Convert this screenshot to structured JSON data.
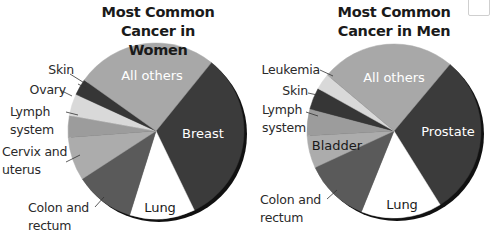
{
  "chart_data": [
    {
      "type": "pie",
      "title": "Most Common Cancer in Women",
      "title_lines": [
        "Most Common",
        "Cancer in Women"
      ],
      "start_angle_deg": 39,
      "direction": "clockwise",
      "slices": [
        {
          "label": "Breast",
          "value": 32,
          "color": "#3b3b3b",
          "label_inside": true,
          "text_color": "#ffffff"
        },
        {
          "label": "Lung",
          "value": 12,
          "color": "#ffffff",
          "label_inside": true,
          "text_color": "#1a1a1a"
        },
        {
          "label": "Colon and rectum",
          "value": 11,
          "color": "#5a5a5a",
          "label_inside": false
        },
        {
          "label": "Cervix and uterus",
          "value": 8,
          "color": "#acacac",
          "label_inside": false
        },
        {
          "label": "Lymph system",
          "value": 4,
          "color": "#9c9c9c",
          "label_inside": false
        },
        {
          "label": "Ovary",
          "value": 4,
          "color": "#d9d9d9",
          "label_inside": false
        },
        {
          "label": "Skin",
          "value": 3,
          "color": "#363636",
          "label_inside": false
        },
        {
          "label": "All others",
          "value": 26,
          "color": "#a8a8a8",
          "label_inside": true,
          "text_color": "#ffffff"
        }
      ],
      "units": "percent (estimated)"
    },
    {
      "type": "pie",
      "title": "Most Common Cancer in Men",
      "title_lines": [
        "Most Common",
        "Cancer in Men"
      ],
      "start_angle_deg": 40,
      "direction": "clockwise",
      "slices": [
        {
          "label": "Prostate",
          "value": 30,
          "color": "#3b3b3b",
          "label_inside": true,
          "text_color": "#ffffff"
        },
        {
          "label": "Lung",
          "value": 15,
          "color": "#ffffff",
          "label_inside": true,
          "text_color": "#1a1a1a"
        },
        {
          "label": "Colon and rectum",
          "value": 12,
          "color": "#5a5a5a",
          "label_inside": false
        },
        {
          "label": "Bladder",
          "value": 6,
          "color": "#acacac",
          "label_inside": true,
          "text_color": "#1a1a1a"
        },
        {
          "label": "Lymph system",
          "value": 5,
          "color": "#9c9c9c",
          "label_inside": false
        },
        {
          "label": "Skin",
          "value": 4,
          "color": "#363636",
          "label_inside": false
        },
        {
          "label": "Leukemia",
          "value": 3,
          "color": "#d9d9d9",
          "label_inside": false
        },
        {
          "label": "All others",
          "value": 25,
          "color": "#a8a8a8",
          "label_inside": true,
          "text_color": "#ffffff"
        }
      ],
      "units": "percent (estimated)"
    }
  ],
  "women": {
    "title_1": "Most Common",
    "title_2": "Cancer in Women",
    "labels": {
      "all_others": "All others",
      "breast": "Breast",
      "lung": "Lung",
      "skin": "Skin",
      "ovary": "Ovary",
      "lymph_1": "Lymph",
      "lymph_2": "system",
      "cervix_1": "Cervix and",
      "cervix_2": "uterus",
      "colon_1": "Colon and",
      "colon_2": "rectum"
    }
  },
  "men": {
    "title_1": "Most Common",
    "title_2": "Cancer in Men",
    "labels": {
      "all_others": "All others",
      "prostate": "Prostate",
      "lung": "Lung",
      "bladder": "Bladder",
      "leukemia": "Leukemia",
      "skin": "Skin",
      "lymph_1": "Lymph",
      "lymph_2": "system",
      "colon_1": "Colon and",
      "colon_2": "rectum"
    }
  }
}
